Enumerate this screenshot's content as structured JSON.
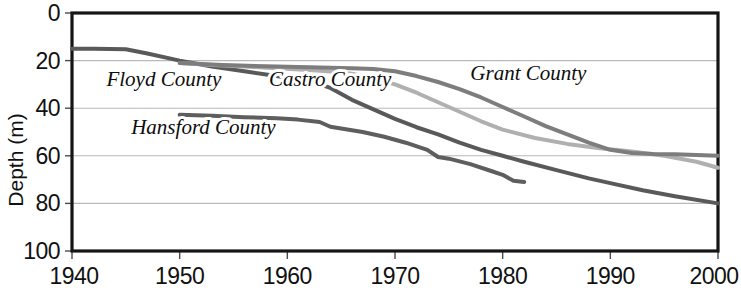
{
  "chart_data": {
    "type": "line",
    "title": "",
    "subtitle": "",
    "xlabel": "",
    "ylabel": "Depth (m)",
    "xlim": [
      1940,
      2000
    ],
    "ylim": [
      0,
      100
    ],
    "y_inverted": true,
    "grid": "horizontal",
    "legend_position": "inline-annotations",
    "xticks": [
      "1940",
      "1950",
      "1960",
      "1970",
      "1980",
      "1990",
      "2000"
    ],
    "xtick_values": [
      1940,
      1950,
      1960,
      1970,
      1980,
      1990,
      2000
    ],
    "yticks": [
      "0",
      "20",
      "40",
      "60",
      "80",
      "100"
    ],
    "ytick_values": [
      0,
      20,
      40,
      60,
      80,
      100
    ],
    "units": "m",
    "series": [
      {
        "name": "Floyd County",
        "color": "#595959",
        "stroke_width": 4.0,
        "label_x": 1943.2,
        "label_y": 30.5,
        "x": [
          1940,
          1942,
          1945,
          1947,
          1950,
          1953,
          1956,
          1959,
          1962,
          1964,
          1966,
          1968,
          1970,
          1972,
          1974,
          1976,
          1978,
          1980,
          1982,
          1985,
          1988,
          1990,
          1993,
          1996,
          2000
        ],
        "y": [
          15.0,
          15.0,
          15.2,
          17.0,
          20.0,
          22.5,
          24.5,
          26.5,
          28.5,
          31.5,
          36.5,
          40.5,
          44.5,
          48.0,
          51.0,
          54.5,
          57.5,
          60.0,
          62.5,
          66.0,
          69.5,
          71.5,
          74.5,
          77.0,
          80.0
        ]
      },
      {
        "name": "Castro County",
        "color": "#b0b0b0",
        "stroke_width": 4.0,
        "label_x": 1958.3,
        "label_y": 30.5,
        "x": [
          1950,
          1953,
          1956,
          1959,
          1962,
          1964,
          1966,
          1968,
          1970,
          1972,
          1974,
          1976,
          1978,
          1980,
          1983,
          1986,
          1989,
          1992,
          1995,
          1998,
          2000
        ],
        "y": [
          21.0,
          21.8,
          22.5,
          23.2,
          24.0,
          24.6,
          25.5,
          27.5,
          30.0,
          33.5,
          37.5,
          41.5,
          45.5,
          49.0,
          52.5,
          55.0,
          56.8,
          58.2,
          60.0,
          62.5,
          65.0
        ]
      },
      {
        "name": "Grant County",
        "color": "#7d7d7d",
        "stroke_width": 4.0,
        "label_x": 1977.0,
        "label_y": 28.0,
        "x": [
          1950,
          1954,
          1958,
          1962,
          1966,
          1968,
          1970,
          1972,
          1974,
          1976,
          1978,
          1980,
          1982,
          1984,
          1986,
          1988,
          1990,
          1992,
          1994,
          1996,
          1998,
          2000
        ],
        "y": [
          21.0,
          21.8,
          22.4,
          22.8,
          23.2,
          23.5,
          24.5,
          26.5,
          29.0,
          32.0,
          35.5,
          39.5,
          43.5,
          47.5,
          51.0,
          54.5,
          57.5,
          58.8,
          59.2,
          59.4,
          59.7,
          60.0
        ]
      },
      {
        "name": "Hansford County",
        "color": "#5e5e5e",
        "stroke_width": 4.0,
        "label_x": 1945.5,
        "label_y": 51.0,
        "x": [
          1950,
          1953,
          1956,
          1959,
          1961,
          1963,
          1964,
          1965,
          1967,
          1969,
          1971,
          1973,
          1974,
          1975,
          1977,
          1979,
          1980,
          1981,
          1982
        ],
        "y": [
          42.8,
          43.2,
          43.8,
          44.2,
          44.8,
          45.8,
          47.8,
          48.5,
          50.0,
          52.0,
          54.5,
          57.5,
          60.5,
          61.2,
          63.5,
          66.5,
          68.0,
          70.5,
          71.0
        ]
      }
    ]
  },
  "axes": {
    "y_title": "Depth (m)"
  }
}
